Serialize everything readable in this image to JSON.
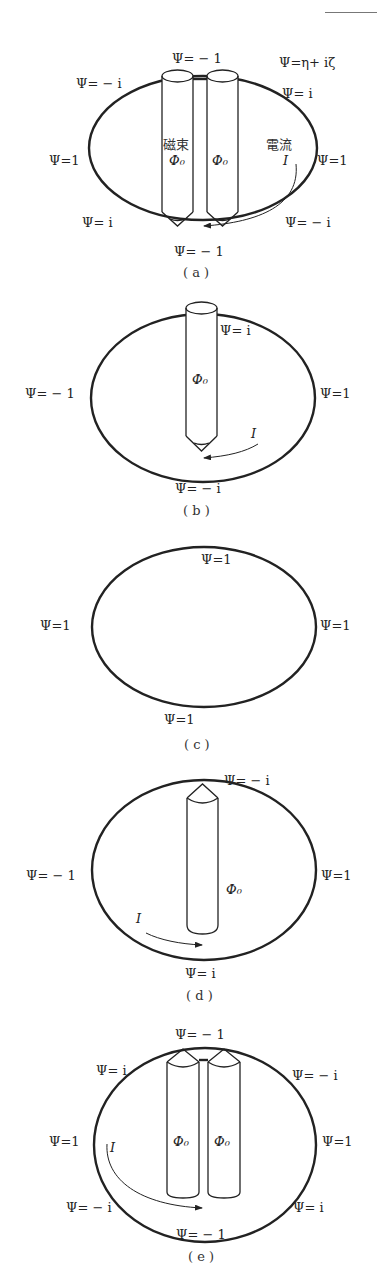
{
  "header": {
    "rule": "page-number-rule"
  },
  "panels": [
    {
      "id": "a",
      "caption": "( a )",
      "labels": {
        "top": "Ψ= − 1",
        "top_right_def": "Ψ=η+ iζ",
        "upper_left": "Ψ= − i",
        "upper_right": "Ψ= i",
        "left": "Ψ=1",
        "right": "Ψ=1",
        "lower_left": "Ψ= i",
        "lower_right": "Ψ= − i",
        "bottom": "Ψ= − 1",
        "flux_jp": "磁束",
        "flux1": "Φ₀",
        "flux2": "Φ₀",
        "current_jp": "電流",
        "current": "I"
      }
    },
    {
      "id": "b",
      "caption": "( b )",
      "labels": {
        "upper_right": "Ψ= i",
        "left": "Ψ= − 1",
        "right": "Ψ=1",
        "flux": "Φ₀",
        "current": "I",
        "bottom": "Ψ= − i"
      }
    },
    {
      "id": "c",
      "caption": "( c )",
      "labels": {
        "top": "Ψ=1",
        "left": "Ψ=1",
        "right": "Ψ=1",
        "bottom": "Ψ=1"
      }
    },
    {
      "id": "d",
      "caption": "( d )",
      "labels": {
        "top": "Ψ= − i",
        "left": "Ψ= − 1",
        "right": "Ψ=1",
        "flux": "Φ₀",
        "current": "I",
        "bottom": "Ψ= i"
      }
    },
    {
      "id": "e",
      "caption": "( e )",
      "labels": {
        "top": "Ψ= − 1",
        "upper_left": "Ψ= i",
        "upper_right": "Ψ= − i",
        "left": "Ψ=1",
        "right": "Ψ=1",
        "flux1": "Φ₀",
        "flux2": "Φ₀",
        "current": "I",
        "lower_left": "Ψ= − i",
        "lower_right": "Ψ= i",
        "bottom": "Ψ= − 1"
      }
    }
  ]
}
